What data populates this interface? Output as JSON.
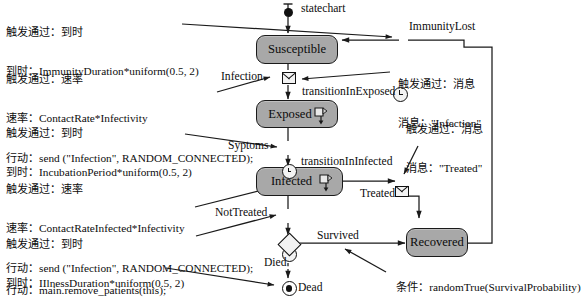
{
  "diagram": {
    "type": "statechart",
    "entry_label": "statechart",
    "states": [
      {
        "id": "susceptible",
        "label": "Susceptible"
      },
      {
        "id": "exposed",
        "label": "Exposed"
      },
      {
        "id": "infected",
        "label": "Infected"
      },
      {
        "id": "recovered",
        "label": "Recovered"
      }
    ],
    "final_state": {
      "id": "dead",
      "label": "Dead"
    },
    "transition_labels": {
      "infection": "Infection",
      "transition_in_exposed": "transitionInExposed",
      "syptoms": "Syptoms",
      "transition_in_infected": "transitionInInfected",
      "treated": "Treated",
      "not_treated": "NotTreated",
      "immunity_lost": "ImmunityLost",
      "survived": "Survived",
      "died": "Died"
    },
    "condition": {
      "prefix": "条件：",
      "expression": "randomTrue(SurvivalProbability)"
    }
  },
  "notes": {
    "immunity_lost_timeout": {
      "line1": "触发通过：到时",
      "line2_label": "到时：",
      "line2_value": "ImmunityDuration*uniform(0.5, 2)"
    },
    "infection_rate": {
      "line1": "触发通过：速率",
      "line2_label": "速率：",
      "line2_value": "ContactRate*Infectivity",
      "line3_label": "行动：",
      "line3_value": "send (\"Infection\", RANDOM_CONNECTED);"
    },
    "incubation_timeout": {
      "line1": "触发通过：到时",
      "line2_label": "到时：",
      "line2_value": "IncubationPeriod*uniform(0.5, 2)"
    },
    "infected_rate": {
      "line1": "触发通过：速率",
      "line2_label": "速率：",
      "line2_value": "ContactRateInfected*Infectivity",
      "line3_label": "行动：",
      "line3_value": "send (\"Infection\", RANDOM_CONNECTED);"
    },
    "illness_timeout": {
      "line1": "触发通过：到时",
      "line2_label": "到时：",
      "line2_value": "IIlnessDuration*uniform(0.5, 2)"
    },
    "remove_action": {
      "line1_label": "行动：",
      "line1_value": "main.remove_patients(this);"
    },
    "infection_message": {
      "line1": "触发通过：消息",
      "line2_label": "消息：",
      "line2_value": "\"Infection\""
    },
    "treated_message": {
      "line1": "触发通过：消息",
      "line2_label": "消息：",
      "line2_value": "\"Treated\""
    }
  },
  "colors": {
    "state_fill": "#a8a8a8",
    "state_stroke": "#1a1a1a",
    "line": "#1a1a1a",
    "background": "#ffffff"
  }
}
